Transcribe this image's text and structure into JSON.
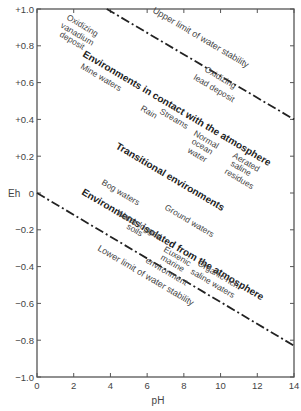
{
  "chart_data": {
    "type": "line",
    "title": "",
    "xlabel": "pH",
    "ylabel": "Eh",
    "xlim": [
      0,
      14
    ],
    "ylim": [
      -1.0,
      1.0
    ],
    "x_ticks": [
      "0",
      "2",
      "4",
      "6",
      "8",
      "10",
      "12",
      "14"
    ],
    "y_ticks": [
      "+1.0",
      "+0.8",
      "+0.6",
      "+0.4",
      "+0.2",
      "0",
      "−0.2",
      "−0.4",
      "−0.6",
      "−0.8",
      "−1.0"
    ],
    "series": [
      {
        "name": "Upper limit of water stability",
        "style": "dash-dot",
        "x": [
          3.8,
          14
        ],
        "y": [
          1.0,
          0.4
        ]
      },
      {
        "name": "Lower limit of water stability",
        "style": "dash-dot",
        "x": [
          0,
          14
        ],
        "y": [
          0.0,
          -0.83
        ]
      }
    ],
    "annotations": {
      "upper_limit": "Upper limit of water stability",
      "lower_limit": "Lower limit of water stability",
      "oxidizing_vanadium": [
        "Oxidizing",
        "vanadium",
        "deposit"
      ],
      "oxidizing_lead": [
        "Oxidizing",
        "lead deposit"
      ],
      "env_contact": "Environments in contact with the atmosphere",
      "mine_waters": "Mine waters",
      "rain": "Rain",
      "streams": "Streams",
      "normal_ocean": [
        "Normal",
        "ocean",
        "water"
      ],
      "aerated_saline": [
        "Aerated",
        "saline",
        "residues"
      ],
      "transitional": "Transitional environments",
      "bog_waters": "Bog waters",
      "ground_waters": "Ground waters",
      "env_isolated": "Environments isolated from the atmosphere",
      "waterlogged": [
        "Water-logged",
        "soils"
      ],
      "euxenic": [
        "Euxenic",
        "marine",
        "environment"
      ],
      "organic_rich": [
        "Organic-rich",
        "saline waters"
      ]
    },
    "grid": false,
    "legend": "none"
  }
}
